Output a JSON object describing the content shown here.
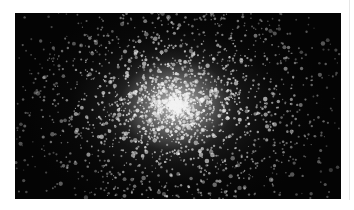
{
  "image": {
    "subject": "globular star cluster",
    "alt": "Dense globular star cluster with bright white core against black sky",
    "colors": {
      "sky": "#040404",
      "core": "#d7d7d7",
      "stars": "#f2f2f2"
    },
    "star_count_approx": 2600
  }
}
